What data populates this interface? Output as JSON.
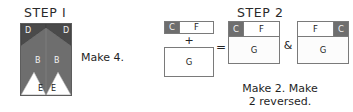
{
  "step1": {
    "heading": "STEP I",
    "caption": "Make 4.",
    "pieces": {
      "d_left": "D",
      "d_right": "D",
      "b_left": "B",
      "b_right": "B",
      "e_left": "E",
      "e_right": "E"
    },
    "colors": {
      "dark_gray": "#4a4a4a",
      "mid_gray": "#6e6e6e",
      "white": "#ffffff",
      "outline": "#5d5d5d"
    }
  },
  "step2": {
    "heading": "STEP 2",
    "caption_line1": "Make 2. Make",
    "caption_line2": "2 reversed.",
    "operators": {
      "plus": "+",
      "equals": "=",
      "ampersand": "&"
    },
    "source": {
      "strip": {
        "c": "C",
        "f": "F"
      },
      "square": {
        "g": "G"
      }
    },
    "result_a": {
      "c": "C",
      "f": "F",
      "g": "G"
    },
    "result_b": {
      "f": "F",
      "c": "C",
      "g": "G"
    },
    "colors": {
      "dark_patch": "#6e6e6e",
      "light_patch": "#ffffff",
      "outline": "#7a7a7a"
    }
  }
}
